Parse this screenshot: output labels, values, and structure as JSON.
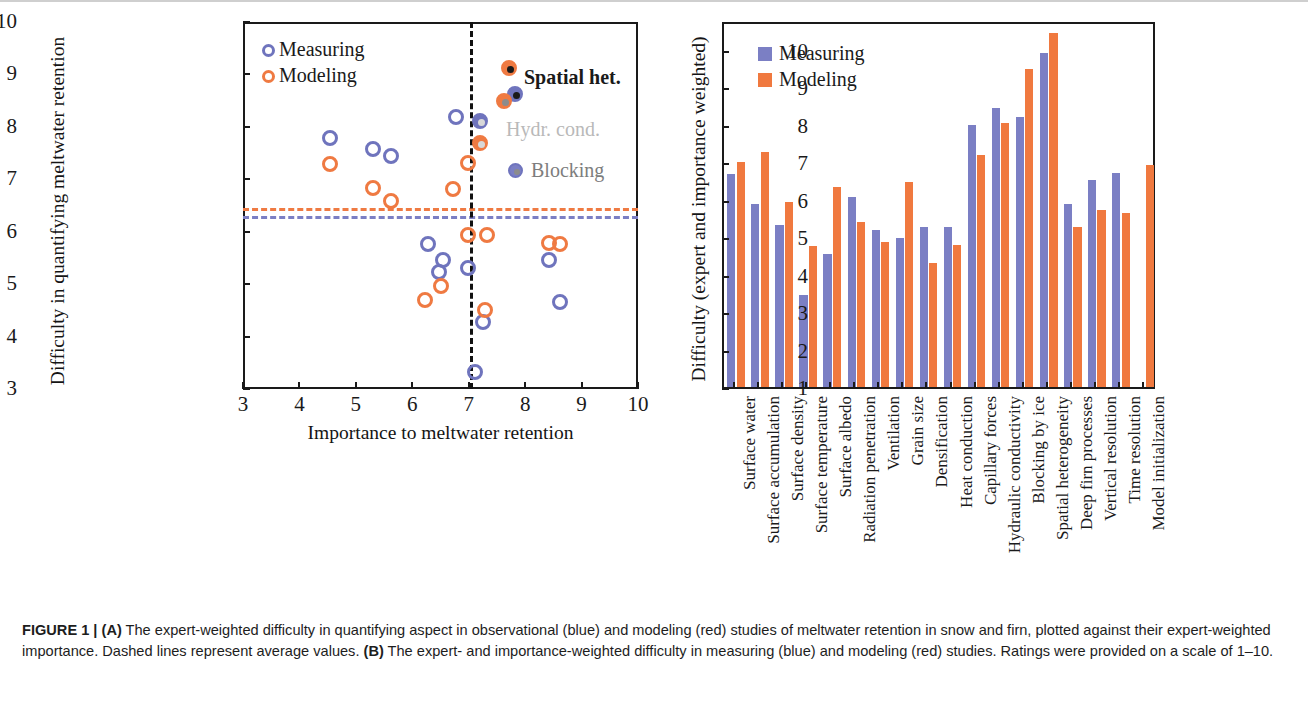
{
  "figure": {
    "caption_label": "FIGURE 1 |",
    "caption_a_tag": "(A)",
    "caption_part1": " The expert-weighted difficulty in quantifying aspect in observational (blue) and modeling (red) studies of meltwater retention in snow and firn, plotted against their expert-weighted importance. Dashed lines represent average values. ",
    "caption_b_tag": "(B)",
    "caption_part2": " The expert- and importance-weighted difficulty in measuring (blue) and modeling (red) studies. Ratings were provided on a scale of 1–10."
  },
  "colors": {
    "measuring_outline": "#6f74bd",
    "modeling_outline": "#ef7a42",
    "measuring_fill": "#7b7fc4",
    "modeling_fill": "#f0793f",
    "axis": "#1a1a1a",
    "dashed_vertical": "#111111",
    "hydr_cond_label": "#b9b9b9",
    "blocking_label": "#7d7d7d"
  },
  "panel_a": {
    "legend": [
      {
        "label": "Measuring",
        "marker": "open-circle-blue"
      },
      {
        "label": "Modeling",
        "marker": "open-circle-orange"
      }
    ],
    "annotations": [
      {
        "name": "spatial-het",
        "label": "Spatial het."
      },
      {
        "name": "hydr-cond",
        "label": "Hydr. cond."
      },
      {
        "name": "blocking",
        "label": "Blocking"
      }
    ],
    "chart_data": {
      "type": "scatter",
      "title": "",
      "xlabel": "Importance to meltwater retention",
      "ylabel": "Difficulty in quantifying meltwater retention",
      "xlim": [
        3,
        10
      ],
      "ylim": [
        3,
        10
      ],
      "xticks": [
        3,
        4,
        5,
        6,
        7,
        8,
        9,
        10
      ],
      "yticks": [
        3,
        4,
        5,
        6,
        7,
        8,
        9,
        10
      ],
      "grid": false,
      "legend_position": "top-left",
      "reference_lines": [
        {
          "name": "modeling-average",
          "orientation": "horizontal",
          "value": 6.45,
          "color": "#ef7a42",
          "style": "dashed"
        },
        {
          "name": "measuring-average",
          "orientation": "horizontal",
          "value": 6.3,
          "color": "#7b7fc4",
          "style": "dashed"
        },
        {
          "name": "importance-average",
          "orientation": "vertical",
          "value": 7.02,
          "color": "#111111",
          "style": "dashed"
        }
      ],
      "series": [
        {
          "name": "Measuring",
          "marker": "open-circle",
          "color": "#6f74bd",
          "points": [
            {
              "x": 4.55,
              "y": 7.78
            },
            {
              "x": 5.3,
              "y": 7.58
            },
            {
              "x": 5.62,
              "y": 7.44
            },
            {
              "x": 6.78,
              "y": 8.18
            },
            {
              "x": 7.2,
              "y": 8.12
            },
            {
              "x": 7.82,
              "y": 8.63
            },
            {
              "x": 6.28,
              "y": 5.76
            },
            {
              "x": 6.55,
              "y": 5.47
            },
            {
              "x": 6.48,
              "y": 5.24
            },
            {
              "x": 6.98,
              "y": 5.31
            },
            {
              "x": 7.25,
              "y": 4.27
            },
            {
              "x": 7.12,
              "y": 3.32
            },
            {
              "x": 8.42,
              "y": 5.46
            },
            {
              "x": 8.62,
              "y": 4.66
            }
          ]
        },
        {
          "name": "Modeling",
          "marker": "open-circle",
          "color": "#ef7a42",
          "points": [
            {
              "x": 4.55,
              "y": 7.3
            },
            {
              "x": 5.3,
              "y": 6.83
            },
            {
              "x": 5.62,
              "y": 6.58
            },
            {
              "x": 6.72,
              "y": 6.82
            },
            {
              "x": 6.98,
              "y": 7.32
            },
            {
              "x": 7.2,
              "y": 7.7
            },
            {
              "x": 7.72,
              "y": 9.12
            },
            {
              "x": 7.62,
              "y": 8.5
            },
            {
              "x": 6.22,
              "y": 4.7
            },
            {
              "x": 6.5,
              "y": 4.96
            },
            {
              "x": 6.98,
              "y": 5.93
            },
            {
              "x": 7.32,
              "y": 5.93
            },
            {
              "x": 7.28,
              "y": 4.5
            },
            {
              "x": 8.42,
              "y": 5.78
            },
            {
              "x": 8.62,
              "y": 5.76
            }
          ]
        }
      ],
      "highlighted_points": [
        {
          "name": "spatial-het-modeling",
          "x": 7.72,
          "y": 9.12,
          "color": "#ef7a42",
          "core": "#1a1a1a"
        },
        {
          "name": "spatial-het-measuring",
          "x": 7.82,
          "y": 8.63,
          "color": "#6f74bd",
          "core": "#1a1a1a"
        },
        {
          "name": "blocking-modeling",
          "x": 7.62,
          "y": 8.5,
          "color": "#ef7a42",
          "core": "#8c8c8c"
        },
        {
          "name": "hydr-cond-measuring",
          "x": 7.2,
          "y": 8.12,
          "color": "#6f74bd",
          "core": "#d8d8d8"
        },
        {
          "name": "hydr-cond-modeling",
          "x": 7.2,
          "y": 7.7,
          "color": "#ef7a42",
          "core": "#d8d8d8"
        }
      ]
    }
  },
  "panel_b": {
    "legend": [
      {
        "label": "Measuring",
        "swatch": "square-blue"
      },
      {
        "label": "Modeling",
        "swatch": "square-orange"
      }
    ],
    "chart_data": {
      "type": "bar",
      "title": "",
      "xlabel": "",
      "ylabel": "Difficulty (expert and importance weighted)",
      "ylim": [
        1,
        10.8
      ],
      "yticks": [
        1,
        2,
        3,
        4,
        5,
        6,
        7,
        8,
        9,
        10
      ],
      "grid": false,
      "legend_position": "top-left",
      "categories": [
        "Surface water",
        "Surface accumulation",
        "Surface density",
        "Surface temperature",
        "Surface albedo",
        "Radiation penetration",
        "Ventilation",
        "Grain size",
        "Densification",
        "Heat conduction",
        "Capillary forces",
        "Hydraulic conductivity",
        "Blocking by ice",
        "Spatial heterogeneity",
        "Deep firn processes",
        "Vertical resolution",
        "Time resolution",
        "Model initialization"
      ],
      "series": [
        {
          "name": "Measuring",
          "color": "#7b7fc4",
          "values": [
            6.68,
            5.88,
            5.32,
            3.46,
            4.56,
            6.08,
            5.18,
            4.98,
            5.26,
            5.26,
            8.0,
            8.44,
            8.2,
            9.92,
            5.88,
            6.54,
            6.72,
            null
          ]
        },
        {
          "name": "Modeling",
          "color": "#f0793f",
          "values": [
            7.02,
            7.28,
            5.94,
            4.76,
            6.34,
            5.4,
            4.88,
            6.48,
            4.3,
            4.8,
            7.2,
            8.04,
            9.48,
            10.46,
            5.26,
            5.74,
            5.66,
            6.94
          ]
        }
      ]
    }
  }
}
